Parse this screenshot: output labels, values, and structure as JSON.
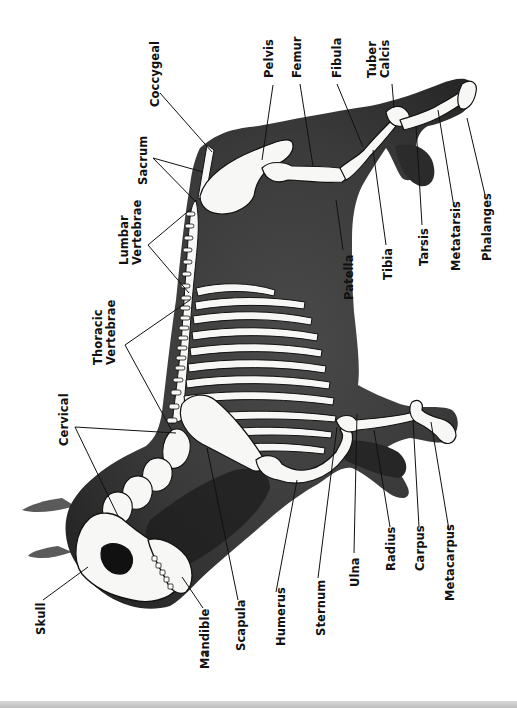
{
  "diagram": {
    "colors": {
      "background": "#ffffff",
      "body_silhouette": "#3c3c3c",
      "body_dark": "#1e1e1e",
      "bone_fill": "#f7f7f5",
      "bone_outline": "#111111",
      "label_text": "#111111",
      "leader_line": "#111111",
      "bottom_strip": "#c8c8c8"
    },
    "labels": [
      {
        "id": "coccygeal",
        "lines": [
          "Coccygeal"
        ],
        "x": 149,
        "y": 107
      },
      {
        "id": "sacrum",
        "lines": [
          "Sacrum"
        ],
        "x": 137,
        "y": 185
      },
      {
        "id": "lumbar-vertebrae",
        "lines": [
          "Lumbar",
          "Vertebrae"
        ],
        "x": 118,
        "y": 265
      },
      {
        "id": "thoracic-vertebrae",
        "lines": [
          "Thoracic",
          "Vertebrae"
        ],
        "x": 92,
        "y": 365
      },
      {
        "id": "cervical",
        "lines": [
          "Cervical"
        ],
        "x": 58,
        "y": 446
      },
      {
        "id": "skull",
        "lines": [
          "Skull"
        ],
        "x": 35,
        "y": 635
      },
      {
        "id": "mandible",
        "lines": [
          "Mandible"
        ],
        "x": 199,
        "y": 669
      },
      {
        "id": "scapula",
        "lines": [
          "Scapula"
        ],
        "x": 235,
        "y": 651
      },
      {
        "id": "humerus",
        "lines": [
          "Humerus"
        ],
        "x": 275,
        "y": 646
      },
      {
        "id": "sternum",
        "lines": [
          "Sternum"
        ],
        "x": 315,
        "y": 636
      },
      {
        "id": "ulna",
        "lines": [
          "Ulna"
        ],
        "x": 349,
        "y": 587
      },
      {
        "id": "radius",
        "lines": [
          "Radius"
        ],
        "x": 385,
        "y": 571
      },
      {
        "id": "carpus",
        "lines": [
          "Carpus"
        ],
        "x": 414,
        "y": 571
      },
      {
        "id": "metacarpus",
        "lines": [
          "Metacarpus"
        ],
        "x": 444,
        "y": 601
      },
      {
        "id": "pelvis",
        "lines": [
          "Pelvis"
        ],
        "x": 263,
        "y": 78
      },
      {
        "id": "femur",
        "lines": [
          "Femur"
        ],
        "x": 291,
        "y": 78
      },
      {
        "id": "fibula",
        "lines": [
          "Fibula"
        ],
        "x": 331,
        "y": 78
      },
      {
        "id": "tuber-calcis",
        "lines": [
          "Tuber",
          "Calcis"
        ],
        "x": 366,
        "y": 78
      },
      {
        "id": "patella",
        "lines": [
          "Patella"
        ],
        "x": 343,
        "y": 300
      },
      {
        "id": "tibia",
        "lines": [
          "Tibia"
        ],
        "x": 382,
        "y": 280
      },
      {
        "id": "tarsis",
        "lines": [
          "Tarsis"
        ],
        "x": 418,
        "y": 266
      },
      {
        "id": "metatarsis",
        "lines": [
          "Metatarsis"
        ],
        "x": 450,
        "y": 271
      },
      {
        "id": "phalanges",
        "lines": [
          "Phalanges"
        ],
        "x": 481,
        "y": 261
      }
    ],
    "leaders": [
      {
        "label": "coccygeal",
        "points": [
          [
            160,
            93
          ],
          [
            212,
            152
          ]
        ]
      },
      {
        "label": "sacrum",
        "points": [
          [
            153,
            158
          ],
          [
            203,
            172
          ]
        ]
      },
      {
        "label": "sacrum",
        "points": [
          [
            153,
            158
          ],
          [
            197,
            203
          ]
        ]
      },
      {
        "label": "lumbar-vertebrae",
        "points": [
          [
            148,
            245
          ],
          [
            192,
            208
          ]
        ]
      },
      {
        "label": "lumbar-vertebrae",
        "points": [
          [
            148,
            245
          ],
          [
            189,
            293
          ]
        ]
      },
      {
        "label": "thoracic-vertebrae",
        "points": [
          [
            125,
            345
          ],
          [
            190,
            300
          ]
        ]
      },
      {
        "label": "thoracic-vertebrae",
        "points": [
          [
            125,
            345
          ],
          [
            172,
            431
          ]
        ]
      },
      {
        "label": "cervical",
        "points": [
          [
            75,
            427
          ],
          [
            176,
            433
          ]
        ]
      },
      {
        "label": "cervical",
        "points": [
          [
            75,
            427
          ],
          [
            118,
            516
          ]
        ]
      },
      {
        "label": "skull",
        "points": [
          [
            43,
            600
          ],
          [
            88,
            567
          ]
        ]
      },
      {
        "label": "mandible",
        "points": [
          [
            203,
            608
          ],
          [
            182,
            577
          ]
        ]
      },
      {
        "label": "scapula",
        "points": [
          [
            238,
            600
          ],
          [
            207,
            448
          ]
        ]
      },
      {
        "label": "humerus",
        "points": [
          [
            276,
            592
          ],
          [
            297,
            480
          ]
        ]
      },
      {
        "label": "sternum",
        "points": [
          [
            318,
            578
          ],
          [
            337,
            427
          ]
        ]
      },
      {
        "label": "ulna",
        "points": [
          [
            354,
            553
          ],
          [
            357,
            414
          ]
        ]
      },
      {
        "label": "radius",
        "points": [
          [
            390,
            527
          ],
          [
            374,
            430
          ]
        ]
      },
      {
        "label": "carpus",
        "points": [
          [
            419,
            527
          ],
          [
            413,
            420
          ]
        ]
      },
      {
        "label": "metacarpus",
        "points": [
          [
            449,
            530
          ],
          [
            431,
            422
          ]
        ]
      },
      {
        "label": "pelvis",
        "points": [
          [
            273,
            85
          ],
          [
            262,
            160
          ]
        ]
      },
      {
        "label": "femur",
        "points": [
          [
            300,
            84
          ],
          [
            313,
            166
          ]
        ]
      },
      {
        "label": "fibula",
        "points": [
          [
            337,
            84
          ],
          [
            363,
            147
          ]
        ]
      },
      {
        "label": "tuber-calcis",
        "points": [
          [
            392,
            84
          ],
          [
            394,
            108
          ]
        ]
      },
      {
        "label": "patella",
        "points": [
          [
            343,
            250
          ],
          [
            336,
            200
          ]
        ]
      },
      {
        "label": "tibia",
        "points": [
          [
            386,
            245
          ],
          [
            373,
            150
          ]
        ]
      },
      {
        "label": "tarsis",
        "points": [
          [
            422,
            225
          ],
          [
            416,
            126
          ]
        ]
      },
      {
        "label": "metatarsis",
        "points": [
          [
            454,
            207
          ],
          [
            438,
            110
          ]
        ]
      },
      {
        "label": "phalanges",
        "points": [
          [
            485,
            195
          ],
          [
            467,
            118
          ]
        ]
      }
    ],
    "page_mark": "2"
  }
}
